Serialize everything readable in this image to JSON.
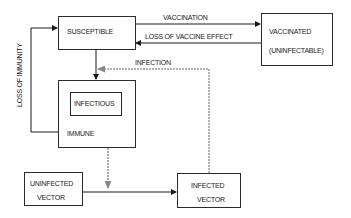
{
  "diagram": {
    "nodes": {
      "susceptible": {
        "label": "SUSCEPTIBLE"
      },
      "vaccinated": {
        "line1": "VACCINATED",
        "line2": "(UNINFECTABLE)"
      },
      "immune": {
        "label": "IMMUNE"
      },
      "infectious": {
        "label": "INFECTIOUS"
      },
      "uninfected_vector": {
        "line1": "UNINFECTED",
        "line2": "VECTOR"
      },
      "infected_vector": {
        "line1": "INFECTED",
        "line2": "VECTOR"
      }
    },
    "edges": {
      "vaccination": {
        "label": "VACCINATION",
        "from": "susceptible",
        "to": "vaccinated",
        "style": "solid"
      },
      "loss_of_vaccine_effect": {
        "label": "LOSS OF VACCINE EFFECT",
        "from": "vaccinated",
        "to": "susceptible",
        "style": "solid"
      },
      "infection": {
        "label": "INFECTION",
        "from": "infected_vector",
        "to": "susceptible-to-immune",
        "style": "dashed"
      },
      "loss_of_immunity": {
        "label": "LOSS OF IMMUNITY",
        "from": "immune",
        "to": "susceptible",
        "style": "solid"
      },
      "susceptible_to_immune": {
        "label": "",
        "from": "susceptible",
        "to": "immune",
        "style": "solid"
      },
      "infectious_to_vector": {
        "label": "",
        "from": "infectious",
        "to": "uninfected-to-infected",
        "style": "dashed"
      },
      "vector_infection": {
        "label": "",
        "from": "uninfected_vector",
        "to": "infected_vector",
        "style": "solid"
      }
    }
  }
}
